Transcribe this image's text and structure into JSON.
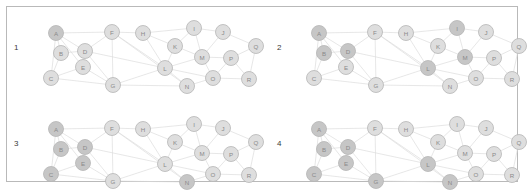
{
  "figure": {
    "width": 526,
    "height": 193,
    "background": "#ffffff",
    "frame_color": "#b9b9b9",
    "panel_count": 4
  },
  "style": {
    "node_fill_light": "#dedede",
    "node_fill_dark": "#c6c6c6",
    "node_fill_darkest": "#bcbcbc",
    "node_stroke": "#b5b5b5",
    "node_radius": 7.5,
    "edge_color": "#dcdcdc",
    "label_color": "#8a8a8a",
    "panel_number_color": "#3a3a3a"
  },
  "chart_data": {
    "type": "scatter",
    "title": "",
    "xlabel": "",
    "ylabel": "",
    "grid": false,
    "legend": "none",
    "node_labels": [
      "A",
      "B",
      "C",
      "D",
      "E",
      "F",
      "G",
      "H",
      "I",
      "J",
      "K",
      "L",
      "M",
      "N",
      "O",
      "P",
      "Q",
      "R"
    ],
    "node_positions": {
      "A": [
        42,
        27
      ],
      "B": [
        47,
        47
      ],
      "C": [
        37,
        72
      ],
      "D": [
        71,
        45
      ],
      "E": [
        69,
        61
      ],
      "F": [
        98,
        26
      ],
      "G": [
        99,
        79
      ],
      "H": [
        129,
        27
      ],
      "I": [
        180,
        22
      ],
      "J": [
        209,
        26
      ],
      "K": [
        161,
        40
      ],
      "L": [
        151,
        62
      ],
      "M": [
        188,
        51
      ],
      "N": [
        173,
        80
      ],
      "O": [
        199,
        72
      ],
      "P": [
        217,
        52
      ],
      "Q": [
        242,
        40
      ],
      "R": [
        235,
        73
      ]
    },
    "edges": [
      [
        "A",
        "F"
      ],
      [
        "A",
        "D"
      ],
      [
        "A",
        "B"
      ],
      [
        "A",
        "C"
      ],
      [
        "A",
        "E"
      ],
      [
        "B",
        "D"
      ],
      [
        "B",
        "C"
      ],
      [
        "C",
        "G"
      ],
      [
        "C",
        "E"
      ],
      [
        "D",
        "E"
      ],
      [
        "D",
        "L"
      ],
      [
        "D",
        "F"
      ],
      [
        "D",
        "G"
      ],
      [
        "E",
        "G"
      ],
      [
        "F",
        "G"
      ],
      [
        "F",
        "H"
      ],
      [
        "F",
        "L"
      ],
      [
        "F",
        "N"
      ],
      [
        "G",
        "L"
      ],
      [
        "G",
        "N"
      ],
      [
        "H",
        "I"
      ],
      [
        "H",
        "K"
      ],
      [
        "H",
        "L"
      ],
      [
        "I",
        "J"
      ],
      [
        "I",
        "K"
      ],
      [
        "I",
        "M"
      ],
      [
        "J",
        "Q"
      ],
      [
        "J",
        "M"
      ],
      [
        "K",
        "L"
      ],
      [
        "K",
        "M"
      ],
      [
        "L",
        "M"
      ],
      [
        "L",
        "N"
      ],
      [
        "L",
        "O"
      ],
      [
        "M",
        "P"
      ],
      [
        "M",
        "O"
      ],
      [
        "N",
        "O"
      ],
      [
        "O",
        "P"
      ],
      [
        "O",
        "R"
      ],
      [
        "P",
        "Q"
      ],
      [
        "P",
        "R"
      ],
      [
        "Q",
        "R"
      ]
    ],
    "panels": [
      {
        "number": "1",
        "highlighted_nodes": [
          "A"
        ],
        "dim_nodes": []
      },
      {
        "number": "2",
        "highlighted_nodes": [
          "A",
          "B",
          "D",
          "I",
          "L",
          "M"
        ],
        "dim_nodes": []
      },
      {
        "number": "3",
        "highlighted_nodes": [
          "A",
          "B",
          "D",
          "E",
          "C",
          "N"
        ],
        "dim_nodes": []
      },
      {
        "number": "4",
        "highlighted_nodes": [
          "A",
          "B",
          "C",
          "D",
          "E",
          "G",
          "L",
          "N"
        ],
        "dim_nodes": []
      }
    ]
  },
  "panels": [
    {
      "number": "1",
      "origin": [
        14,
        6
      ]
    },
    {
      "number": "2",
      "origin": [
        277,
        6
      ]
    },
    {
      "number": "3",
      "origin": [
        14,
        102
      ]
    },
    {
      "number": "4",
      "origin": [
        277,
        102
      ]
    }
  ]
}
